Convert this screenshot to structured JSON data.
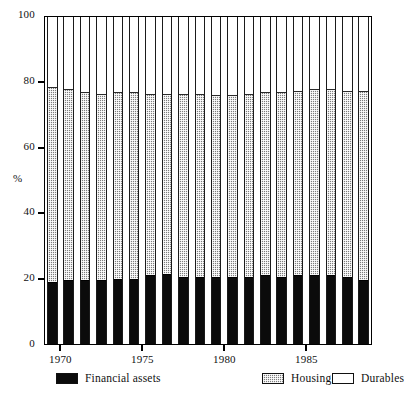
{
  "chart_data": {
    "type": "bar",
    "stacked": true,
    "title": "",
    "xlabel": "",
    "ylabel": "%",
    "ylim": [
      0,
      100
    ],
    "yticks": [
      0,
      20,
      40,
      60,
      80,
      100
    ],
    "xticks": [
      1970,
      1975,
      1980,
      1985
    ],
    "xtick_labels": [
      "1970",
      "1975",
      "1980",
      "1985"
    ],
    "grid": false,
    "legend_position": "bottom",
    "categories": [
      "1970",
      "1971",
      "1972",
      "1973",
      "1974",
      "1975",
      "1976",
      "1977",
      "1978",
      "1979",
      "1980",
      "1981",
      "1982",
      "1983",
      "1984",
      "1985",
      "1986",
      "1987",
      "1988",
      "1989"
    ],
    "series": [
      {
        "name": "Financial assets",
        "color": "#0b0b0b",
        "pattern": "solid",
        "values": [
          19.0,
          19.5,
          19.5,
          19.5,
          20.0,
          20.0,
          21.0,
          21.5,
          20.5,
          20.5,
          20.5,
          20.5,
          20.5,
          21.0,
          20.5,
          21.0,
          21.0,
          21.0,
          20.5,
          19.5
        ]
      },
      {
        "name": "Housing",
        "color": "#7d7d7d",
        "pattern": "checkered",
        "values": [
          59.5,
          58.5,
          57.5,
          57.0,
          57.0,
          57.0,
          55.5,
          55.0,
          56.0,
          56.0,
          55.5,
          55.5,
          56.0,
          56.0,
          56.5,
          56.5,
          57.0,
          57.0,
          57.0,
          58.0
        ]
      },
      {
        "name": "Durables",
        "color": "#ffffff",
        "pattern": "empty",
        "values": [
          21.5,
          22.0,
          23.0,
          23.5,
          23.0,
          23.0,
          23.5,
          23.5,
          23.5,
          23.5,
          24.0,
          24.0,
          23.5,
          23.0,
          23.0,
          22.5,
          22.0,
          22.0,
          22.5,
          22.5
        ]
      }
    ],
    "stack_tops": {
      "financial_assets": [
        19.0,
        19.5,
        19.5,
        19.5,
        20.0,
        20.0,
        21.0,
        21.5,
        20.5,
        20.5,
        20.5,
        20.5,
        20.5,
        21.0,
        20.5,
        21.0,
        21.0,
        21.0,
        20.5,
        19.5
      ],
      "housing": [
        78.5,
        78.0,
        77.0,
        76.5,
        77.0,
        77.0,
        76.5,
        76.5,
        76.5,
        76.5,
        76.0,
        76.0,
        76.5,
        77.0,
        77.0,
        77.5,
        78.0,
        78.0,
        77.5,
        77.5
      ]
    }
  },
  "axis": {
    "y_title": "%",
    "y_labels": [
      "100",
      "80",
      "60",
      "40",
      "20",
      "0"
    ],
    "x_labels": [
      "1970",
      "1975",
      "1980",
      "1985"
    ]
  },
  "legend": {
    "items": [
      {
        "label": "Financial assets",
        "swatch": "solid-black-swatch"
      },
      {
        "label": "Housing",
        "swatch": "checkered-gray-swatch"
      },
      {
        "label": "Durables",
        "swatch": "empty-white-swatch"
      }
    ]
  }
}
